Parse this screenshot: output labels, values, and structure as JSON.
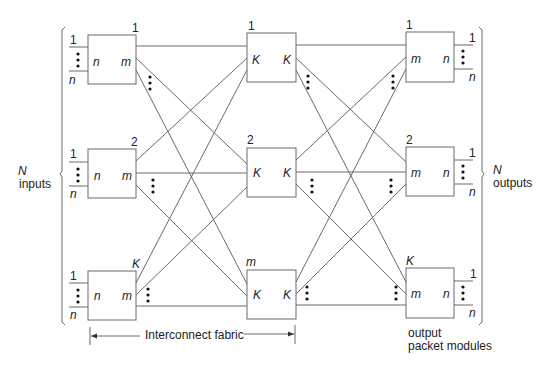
{
  "diagram": {
    "type": "three-stage switching fabric (Clos network)",
    "left_brace_label": {
      "symbol": "N",
      "text": "inputs"
    },
    "right_brace_label": {
      "symbol": "N",
      "text": "outputs"
    },
    "fabric_label": "Interconnect fabric",
    "output_modules_label_line1": "output",
    "output_modules_label_line2": "packet modules",
    "port_first": "1",
    "port_last": "n",
    "input_stage": {
      "modules": [
        {
          "index": "1",
          "left": "n",
          "right": "m"
        },
        {
          "index": "2",
          "left": "n",
          "right": "m"
        },
        {
          "index": "K",
          "left": "n",
          "right": "m"
        }
      ]
    },
    "middle_stage": {
      "modules": [
        {
          "index": "1",
          "left": "K",
          "right": "K"
        },
        {
          "index": "2",
          "left": "K",
          "right": "K"
        },
        {
          "index": "m",
          "left": "K",
          "right": "K"
        }
      ]
    },
    "output_stage": {
      "modules": [
        {
          "index": "1",
          "left": "m",
          "right": "n"
        },
        {
          "index": "2",
          "left": "m",
          "right": "n"
        },
        {
          "index": "K",
          "left": "m",
          "right": "n"
        }
      ]
    }
  }
}
